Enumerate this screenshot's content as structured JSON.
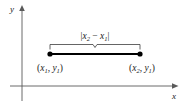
{
  "figure": {
    "name": "coordinate-plane-horizontal-distance",
    "background_color": "#ffffff",
    "axis_color": "#5a5a5a",
    "segment_color": "#000000",
    "brace_color": "#3d3d3d",
    "text_color": "#1a1a1a"
  },
  "axes": {
    "x_label": "x",
    "y_label": "y",
    "x_axis": {
      "x1": 10,
      "y1": 86,
      "x2": 175,
      "y2": 86
    },
    "y_axis": {
      "x1": 22,
      "y1": 8,
      "x2": 22,
      "y2": 101
    }
  },
  "segment": {
    "left_point": {
      "x": 50,
      "y": 54
    },
    "right_point": {
      "x": 140,
      "y": 54
    },
    "left_label": {
      "open": "(",
      "x_var": "x",
      "x_sub": "1",
      "comma": ", ",
      "y_var": "y",
      "y_sub": "1",
      "close": ")"
    },
    "right_label": {
      "open": "(",
      "x_var": "x",
      "x_sub": "2",
      "comma": ", ",
      "y_var": "y",
      "y_sub": "1",
      "close": ")"
    }
  },
  "brace": {
    "label": {
      "bar_open": "|",
      "x_var": "x",
      "x_sub": "2",
      "minus": " − ",
      "x_var2": "x",
      "x_sub2": "1",
      "bar_close": "|"
    },
    "left_x": 50,
    "right_x": 140,
    "y": 44
  }
}
